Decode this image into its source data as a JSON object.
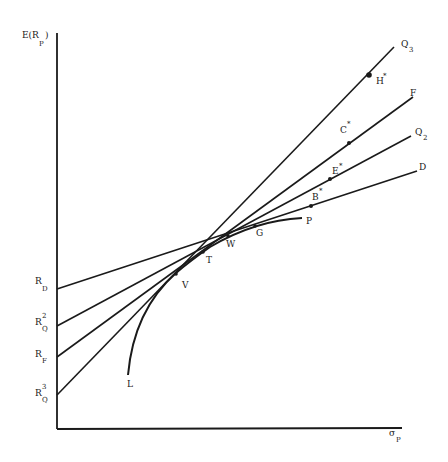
{
  "diagram": {
    "axes": {
      "y_label": "E(R",
      "y_label_sub": "P",
      "y_label_close": ")",
      "x_label": "σ",
      "x_label_sub": "P"
    },
    "intercepts": [
      {
        "id": "RD",
        "main": "R",
        "sub": "D",
        "sup": ""
      },
      {
        "id": "RQ2",
        "main": "R",
        "sub": "Q",
        "sup": "2"
      },
      {
        "id": "RF",
        "main": "R",
        "sub": "F",
        "sup": ""
      },
      {
        "id": "RQ3",
        "main": "R",
        "sub": "Q",
        "sup": "3"
      }
    ],
    "lines": [
      {
        "id": "Q3",
        "label": "Q",
        "sub": "3"
      },
      {
        "id": "F",
        "label": "F",
        "sub": ""
      },
      {
        "id": "Q2",
        "label": "Q",
        "sub": "2"
      },
      {
        "id": "D",
        "label": "D",
        "sub": ""
      }
    ],
    "line_points": [
      {
        "id": "H",
        "label": "H",
        "star": "*"
      },
      {
        "id": "C",
        "label": "C",
        "star": "*"
      },
      {
        "id": "E",
        "label": "E",
        "star": "*"
      },
      {
        "id": "B",
        "label": "B",
        "star": "*"
      }
    ],
    "frontier_points": [
      {
        "id": "L",
        "label": "L"
      },
      {
        "id": "V",
        "label": "V"
      },
      {
        "id": "T",
        "label": "T"
      },
      {
        "id": "W",
        "label": "W"
      },
      {
        "id": "G",
        "label": "G"
      },
      {
        "id": "P",
        "label": "P"
      }
    ]
  }
}
